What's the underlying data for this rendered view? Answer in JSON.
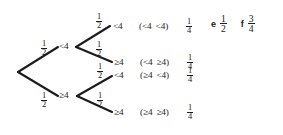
{
  "diagram": {
    "type": "probability-tree",
    "title": "",
    "background_color": "#ffffff",
    "ink_color": "#1c1c1c",
    "root": {
      "label": ""
    },
    "level1": [
      {
        "id": "l1-a",
        "prob_num": "1",
        "prob_den": "2",
        "state": "<4"
      },
      {
        "id": "l1-b",
        "prob_num": "1",
        "prob_den": "2",
        "state": "≥4"
      }
    ],
    "level2": [
      {
        "id": "leaf-1",
        "prob_num": "1",
        "prob_den": "2",
        "state": "<4",
        "outcome_first": "<4",
        "outcome_second": "<4",
        "outcome_prob_num": "1",
        "outcome_prob_den": "4",
        "paren_open": "(",
        "paren_close": ")"
      },
      {
        "id": "leaf-2",
        "prob_num": "1",
        "prob_den": "2",
        "state": "≥4",
        "outcome_first": "<4",
        "outcome_second": "≥4",
        "outcome_prob_num": "1",
        "outcome_prob_den": "4",
        "paren_open": "(",
        "paren_close": ")"
      },
      {
        "id": "leaf-3",
        "prob_num": "1",
        "prob_den": "2",
        "state": "<4",
        "outcome_first": "≥4",
        "outcome_second": "<4",
        "outcome_prob_num": "1",
        "outcome_prob_den": "4",
        "paren_open": "(",
        "paren_close": ")"
      },
      {
        "id": "leaf-4",
        "prob_num": "1",
        "prob_den": "2",
        "state": "≥4",
        "outcome_first": "≥4",
        "outcome_second": "≥4",
        "outcome_prob_num": "1",
        "outcome_prob_den": "4",
        "paren_open": "(",
        "paren_close": ")"
      }
    ]
  },
  "answers": [
    {
      "key": "e",
      "num": "1",
      "den": "2"
    },
    {
      "key": "f",
      "num": "3",
      "den": "4"
    }
  ]
}
